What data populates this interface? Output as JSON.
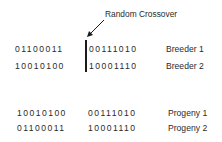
{
  "annotation": "Random Crossover",
  "breeders": [
    {
      "left": "01100011",
      "right": "00111010",
      "label": "Breeder 1"
    },
    {
      "left": "10010100",
      "right": "10001110",
      "label": "Breeder 2"
    }
  ],
  "progeny": [
    {
      "left": "10010100",
      "right": "00111010",
      "label": "Progeny 1"
    },
    {
      "left": "01100011",
      "right": "10001110",
      "label": "Progeny 2"
    }
  ]
}
